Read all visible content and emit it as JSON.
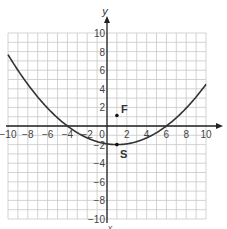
{
  "chart_data": {
    "type": "line",
    "title": "",
    "xlabel": "x",
    "ylabel": "y",
    "xlim": [
      -10,
      10
    ],
    "ylim": [
      -10,
      10
    ],
    "grid": true,
    "x_ticks": [
      -10,
      -8,
      -6,
      -4,
      -2,
      0,
      2,
      4,
      6,
      8,
      10
    ],
    "y_ticks": [
      -10,
      -8,
      -6,
      -4,
      -2,
      2,
      4,
      6,
      8,
      10
    ],
    "series": [
      {
        "name": "parabola",
        "equation": "y = 0.08(x + 4)(x - 6)",
        "x": [
          -10,
          -8,
          -6,
          -4,
          -2,
          0,
          1,
          2,
          4,
          6,
          8,
          10
        ],
        "y": [
          7.68,
          4.48,
          1.92,
          0,
          -1.28,
          -1.92,
          -2,
          -1.92,
          -1.28,
          0,
          1.92,
          4.48
        ]
      }
    ],
    "points": [
      {
        "label": "F",
        "x": 1,
        "y": 1.125
      },
      {
        "label": "S",
        "x": 1,
        "y": -2
      }
    ],
    "annotations": [
      "F",
      "S"
    ]
  }
}
